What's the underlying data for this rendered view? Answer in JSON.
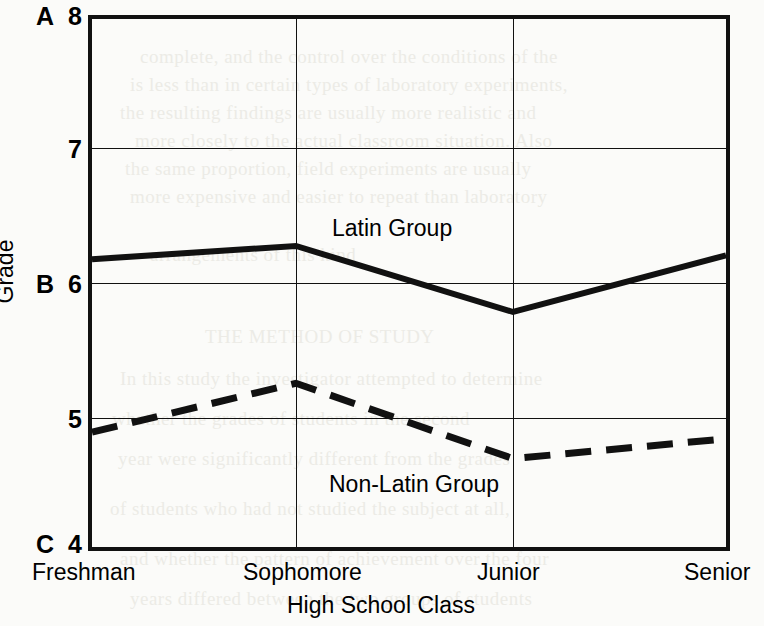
{
  "chart_data": {
    "type": "line",
    "title": "",
    "xlabel": "High School Class",
    "ylabel": "Grade",
    "categories": [
      "Freshman",
      "Sophomore",
      "Junior",
      "Senior"
    ],
    "ylim": [
      4,
      8
    ],
    "yticks": [
      4,
      5,
      6,
      7,
      8
    ],
    "ytick_labels": [
      "4",
      "5",
      "6",
      "7",
      "8"
    ],
    "ytick_letter_labels": [
      "C",
      "",
      "B",
      "",
      "A"
    ],
    "grid": "both",
    "legend": "inline-annotations",
    "series": [
      {
        "name": "Latin Group",
        "style": "solid",
        "values": [
          6.18,
          6.28,
          5.78,
          6.21
        ]
      },
      {
        "name": "Non-Latin Group",
        "style": "dashed",
        "values": [
          4.87,
          5.24,
          4.67,
          4.82
        ]
      }
    ],
    "annotations": [
      {
        "text": "Latin Group",
        "x": "between-sophomore-and-junior",
        "y": 6.6
      },
      {
        "text": "Non-Latin Group",
        "x": "between-sophomore-and-junior",
        "y": 4.45
      }
    ]
  },
  "axis": {
    "y_letters": {
      "top": "A",
      "middle": "B",
      "bottom": "C"
    },
    "y_numbers": {
      "top": "8",
      "seven": "7",
      "six": "6",
      "five": "5",
      "bottom": "4"
    },
    "y_title": "Grade",
    "x_title": "High School Class",
    "x_categories": [
      "Freshman",
      "Sophomore",
      "Junior",
      "Senior"
    ]
  },
  "annotations": {
    "latin": "Latin Group",
    "non_latin": "Non-Latin Group"
  },
  "bleed_text": {
    "lines": [
      "complete, and the control over the conditions of the",
      "is less than in certain types of laboratory experiments,",
      "the resulting findings are usually more realistic and",
      "more closely to the actual classroom situation. Also",
      "the same proportion, field experiments are usually",
      "more expensive and easier to repeat than laboratory",
      "arrangements of this kind",
      "THE METHOD OF STUDY",
      "In this study the investigator attempted to determine",
      "whether the grades of students in the second",
      "year were significantly different from the grades",
      "of students who had not studied the subject at all,",
      "and whether the pattern of achievement over the four",
      "years differed between the two groups of students"
    ]
  }
}
